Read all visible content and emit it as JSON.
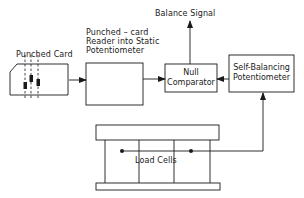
{
  "diagram": {
    "type": "block-diagram",
    "colors": {
      "stroke": "#1a1a1a",
      "background": "#ffffff"
    },
    "labels": {
      "punched_card": "Punched Card",
      "reader_line1": "Punched – card",
      "reader_line2": "Reader into Static",
      "reader_line3": "Potentiometer",
      "balance_signal": "Balance Signal",
      "null_line1": "Null",
      "null_line2": "Comparator",
      "selfbal_line1": "Self-Balancing",
      "selfbal_line2": "Potentiometer",
      "load_cells": "Load Cells"
    },
    "nodes": [
      {
        "id": "punched-card",
        "label": "Punched Card"
      },
      {
        "id": "card-reader",
        "label": "Punched – card Reader into Static Potentiometer"
      },
      {
        "id": "null-comparator",
        "label": "Null Comparator"
      },
      {
        "id": "self-balancing-potentiometer",
        "label": "Self-Balancing Potentiometer"
      },
      {
        "id": "load-cells",
        "label": "Load Cells"
      },
      {
        "id": "balance-signal",
        "label": "Balance Signal"
      }
    ],
    "edges": [
      {
        "from": "punched-card",
        "to": "card-reader"
      },
      {
        "from": "card-reader",
        "to": "null-comparator"
      },
      {
        "from": "self-balancing-potentiometer",
        "to": "null-comparator"
      },
      {
        "from": "null-comparator",
        "to": "balance-signal"
      },
      {
        "from": "load-cells",
        "to": "self-balancing-potentiometer"
      }
    ]
  }
}
